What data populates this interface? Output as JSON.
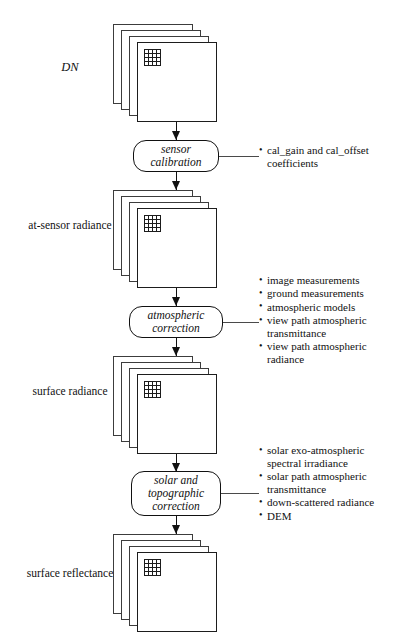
{
  "figure": {
    "type": "flowchart",
    "orientation": "top-to-bottom"
  },
  "stages": [
    {
      "id": "dn",
      "label": "DN",
      "style": "italic"
    },
    {
      "id": "at-sensor-radiance",
      "label": "at-sensor radiance",
      "style": "roman"
    },
    {
      "id": "surface-radiance",
      "label": "surface radiance",
      "style": "roman"
    },
    {
      "id": "surface-reflectance",
      "label": "surface reflectance",
      "style": "roman"
    }
  ],
  "processes": [
    {
      "id": "sensor-calibration",
      "label": "sensor\ncalibration"
    },
    {
      "id": "atmospheric-correction",
      "label": "atmospheric\ncorrection"
    },
    {
      "id": "solar-and-topographic-correction",
      "label": "solar and\ntopographic\ncorrection"
    }
  ],
  "notes": [
    {
      "id": "sensor-calibration-inputs",
      "items": [
        "cal_gain and cal_offset coefficients"
      ]
    },
    {
      "id": "atmospheric-correction-inputs",
      "items": [
        "image measurements",
        "ground measurements",
        "atmospheric models",
        "view path atmospheric transmittance",
        "view path atmospheric radiance"
      ]
    },
    {
      "id": "solar-topographic-correction-inputs",
      "items": [
        "solar exo-atmospheric spectral irradiance",
        "solar path atmospheric transmittance",
        "down-scattered radiance",
        "DEM"
      ]
    }
  ],
  "colors": {
    "background": "#ffffff",
    "line": "#111111",
    "sheet_border": "#3c3c3c",
    "text": "#111111"
  }
}
